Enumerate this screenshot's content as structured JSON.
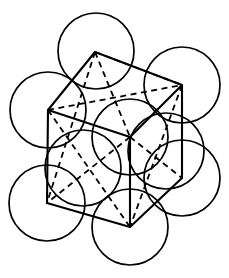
{
  "figure": {
    "domain": "diagram",
    "canvas": {
      "width": 229,
      "height": 278,
      "background": "#ffffff"
    },
    "line_color": "#000000",
    "sphere_stroke_width": 1.7,
    "edge_stroke_width": 2.1,
    "hidden_edge_stroke_width": 1.8,
    "hidden_edge_dash": "6 4.5"
  },
  "spheres": {
    "label": "atom spheres",
    "radius": 38,
    "count": 9,
    "items": [
      {
        "name": "sphere-top",
        "cx": 96,
        "cy": 51,
        "r": 38
      },
      {
        "name": "sphere-upper-left",
        "cx": 48,
        "cy": 110,
        "r": 38
      },
      {
        "name": "sphere-upper-right",
        "cx": 182,
        "cy": 85,
        "r": 38
      },
      {
        "name": "sphere-center",
        "cx": 130,
        "cy": 137,
        "r": 38
      },
      {
        "name": "sphere-mid-left",
        "cx": 83,
        "cy": 168,
        "r": 38
      },
      {
        "name": "sphere-mid-right",
        "cx": 166,
        "cy": 151,
        "r": 38
      },
      {
        "name": "sphere-lower-left",
        "cx": 47,
        "cy": 203,
        "r": 38
      },
      {
        "name": "sphere-lower-right",
        "cx": 182,
        "cy": 178,
        "r": 38
      },
      {
        "name": "sphere-bottom",
        "cx": 130,
        "cy": 227,
        "r": 38
      }
    ]
  },
  "cell_vertices": {
    "label": "cube corner positions in projection",
    "items": [
      {
        "name": "vertex-top",
        "x": 95,
        "y": 52
      },
      {
        "name": "vertex-left",
        "x": 48,
        "y": 110
      },
      {
        "name": "vertex-right",
        "x": 182,
        "y": 85
      },
      {
        "name": "vertex-center",
        "x": 130,
        "y": 137
      },
      {
        "name": "vertex-lower-left",
        "x": 47,
        "y": 203
      },
      {
        "name": "vertex-lower-right",
        "x": 182,
        "y": 178
      },
      {
        "name": "vertex-bottom",
        "x": 130,
        "y": 227
      }
    ]
  },
  "edges_visible": {
    "label": "solid cube edges (front / outline)",
    "items": [
      {
        "name": "edge-top-to-left",
        "path": "M 95 52 L 48 110"
      },
      {
        "name": "edge-top-to-right",
        "path": "M 95 52 L 182 85"
      },
      {
        "name": "edge-left-to-lower-left",
        "path": "M 48 110 L 47 203"
      },
      {
        "name": "edge-right-to-lower-right",
        "path": "M 182 85 L 182 178"
      },
      {
        "name": "edge-lower-left-to-bottom",
        "path": "M 47 203 L 130 227"
      },
      {
        "name": "edge-lower-right-to-bottom",
        "path": "M 182 178 L 130 227"
      },
      {
        "name": "edge-left-to-center",
        "path": "M 48 110 L 130 137"
      },
      {
        "name": "edge-right-to-center",
        "path": "M 182 85 L 130 137"
      },
      {
        "name": "edge-center-to-bottom",
        "path": "M 130 137 L 130 227"
      }
    ]
  },
  "edges_hidden": {
    "label": "dashed hidden cube edges and diagonals",
    "items": [
      {
        "name": "hidden-edge-left-to-right",
        "path": "M 48 110 L 182 85"
      },
      {
        "name": "hidden-edge-top-to-center",
        "path": "M 95 52 L 130 137"
      },
      {
        "name": "hidden-diagonal-top-to-lower-left",
        "path": "M 95 52 L 47 203"
      },
      {
        "name": "hidden-diagonal-left-to-bottom",
        "path": "M 48 110 L 130 227"
      },
      {
        "name": "hidden-diagonal-right-to-bottom",
        "path": "M 182 85 L 130 227"
      },
      {
        "name": "hidden-diagonal-center-to-lowerleft",
        "path": "M 130 137 L 47 203"
      },
      {
        "name": "hidden-diagonal-center-to-lowerright",
        "path": "M 130 137 L 182 178"
      },
      {
        "name": "hidden-diagonal-topright-inner",
        "path": "M 95 52 L 182 85"
      }
    ]
  }
}
